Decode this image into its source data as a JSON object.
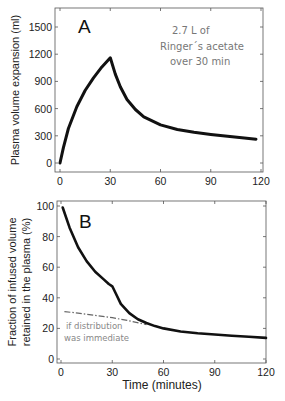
{
  "chart_data": [
    {
      "type": "line",
      "panel_label": "A",
      "title": "",
      "xlabel": "",
      "ylabel": "Plasma volume expansion (ml)",
      "xlim": [
        0,
        120
      ],
      "ylim": [
        -50,
        1700
      ],
      "xticks": [
        0,
        30,
        60,
        90,
        120
      ],
      "yticks": [
        0,
        300,
        600,
        900,
        1200,
        1500
      ],
      "grid": false,
      "annotation": [
        "2.7 L of",
        "Ringer´s acetate",
        "over 30 min"
      ],
      "series": [
        {
          "name": "Plasma volume expansion",
          "style": "solid",
          "x": [
            0,
            2,
            5,
            10,
            15,
            20,
            25,
            30,
            33,
            36,
            40,
            45,
            50,
            60,
            70,
            80,
            90,
            100,
            110,
            117
          ],
          "y": [
            0,
            170,
            380,
            620,
            800,
            940,
            1060,
            1160,
            980,
            840,
            700,
            590,
            510,
            420,
            370,
            340,
            315,
            295,
            275,
            262
          ]
        }
      ]
    },
    {
      "type": "line",
      "panel_label": "B",
      "title": "",
      "xlabel": "Time (minutes)",
      "ylabel": "Fraction of infused volume retained in the plasma (%)",
      "xlim": [
        0,
        120
      ],
      "ylim": [
        -2,
        102
      ],
      "xticks": [
        0,
        30,
        60,
        90,
        120
      ],
      "yticks": [
        0,
        20,
        40,
        60,
        80,
        100
      ],
      "grid": false,
      "annotation": [
        "if distribution",
        "was immediate"
      ],
      "series": [
        {
          "name": "Retained fraction",
          "style": "solid",
          "x": [
            1,
            5,
            10,
            15,
            20,
            25,
            28,
            30,
            32,
            35,
            40,
            45,
            50,
            55,
            60,
            70,
            80,
            90,
            100,
            110,
            120
          ],
          "y": [
            99,
            86,
            73,
            64,
            57,
            52,
            49,
            47.5,
            43,
            36,
            30,
            26,
            23.5,
            21.5,
            20,
            18,
            16.8,
            16,
            15.2,
            14.5,
            13.8
          ]
        },
        {
          "name": "if distribution was immediate",
          "style": "dash-dot",
          "x": [
            2,
            10,
            20,
            30,
            40,
            50
          ],
          "y": [
            31,
            30,
            28.5,
            27,
            25,
            22.5
          ]
        }
      ]
    }
  ],
  "labels": {
    "panel_a": "A",
    "panel_b": "B",
    "a_ylabel": "Plasma volume expansion (ml)",
    "b_ylabel_line1": "Fraction of infused volume",
    "b_ylabel_line2": "retained in the plasma (%)",
    "b_xlabel": "Time (minutes)",
    "a_note_line1": "2.7 L of",
    "a_note_line2": "Ringer´s acetate",
    "a_note_line3": "over 30 min",
    "b_note_line1": "if distribution",
    "b_note_line2": "was immediate"
  },
  "colors": {
    "curve": "#111111",
    "dashed": "#666666",
    "note": "#777777",
    "axis": "#555555"
  }
}
